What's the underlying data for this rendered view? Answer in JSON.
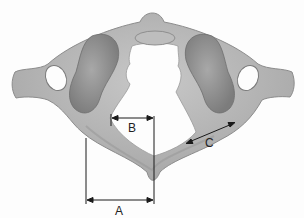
{
  "figure": {
    "colors": {
      "bone": "#b4b4b4",
      "bone_dark": "#8e8e8e",
      "bone_light": "#d2d2d2",
      "line": "#1a1a1a",
      "background": "#fdfdfd"
    },
    "labels": {
      "A": "A",
      "B": "B",
      "C": "C"
    },
    "measurements": [
      {
        "id": "A",
        "description": "horizontal dimension from lateral mass edge to posterior tubercle midline",
        "type": "double-arrow horizontal"
      },
      {
        "id": "B",
        "description": "horizontal dimension from inner lateral mass to midline of vertebral foramen",
        "type": "double-arrow horizontal"
      },
      {
        "id": "C",
        "description": "oblique dimension along posterior arch",
        "type": "double-arrow oblique"
      }
    ]
  }
}
